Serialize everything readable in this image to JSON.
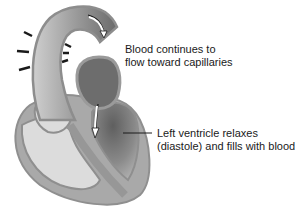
{
  "diagram": {
    "labels": [
      {
        "id": "aorta-flow",
        "lines": [
          "Blood continues to",
          "flow toward capillaries"
        ]
      },
      {
        "id": "left-ventricle",
        "lines": [
          "Left ventricle relaxes",
          "(diastole) and fills with blood"
        ]
      }
    ],
    "colors": {
      "outer_wall": "#9a9a9a",
      "light_chamber": "#d8d8d8",
      "dark_chamber": "#6f6f6f",
      "arrow": "#1a1a1a",
      "flow_arrow": "#ffffff"
    },
    "recoil_arrows": {
      "outer_count": 3,
      "inner_count": 3
    }
  }
}
